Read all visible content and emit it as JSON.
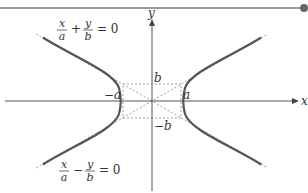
{
  "diagram": {
    "axes": {
      "x_label": "x",
      "y_label": "y"
    },
    "vertex_labels": {
      "left": "−a",
      "right": "a"
    },
    "box_labels": {
      "top": "b",
      "bottom": "−b"
    },
    "asymptotes": {
      "upper_left": {
        "num1": "x",
        "den1": "a",
        "op": "+",
        "num2": "y",
        "den2": "b",
        "eq": "= 0"
      },
      "lower_left": {
        "num1": "x",
        "den1": "a",
        "op": "−",
        "num2": "y",
        "den2": "b",
        "eq": "= 0"
      }
    },
    "colors": {
      "curve": "#555555",
      "axis": "#555555",
      "dotted": "#888888",
      "top_rule": "#777777"
    }
  }
}
